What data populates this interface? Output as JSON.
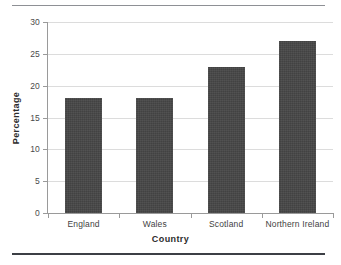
{
  "chart_data": {
    "type": "bar",
    "title": "",
    "categories": [
      "England",
      "Wales",
      "Scotland",
      "Northern Ireland"
    ],
    "values": [
      18,
      18,
      23,
      27
    ],
    "xlabel": "Country",
    "ylabel": "Percentage",
    "ylim": [
      0,
      30
    ],
    "ytick_labels": [
      "0",
      "5",
      "10",
      "15",
      "20",
      "25",
      "30"
    ],
    "ytick_values": [
      0,
      5,
      10,
      15,
      20,
      25,
      30
    ],
    "grid": "horizontal",
    "legend": "none",
    "bar_color": "#464646",
    "gridline_color": "#dcdcdc",
    "axis_color": "#9a9a9a",
    "rule_top_color": "#8e9095",
    "rule_bottom_color": "#3c3f45"
  }
}
